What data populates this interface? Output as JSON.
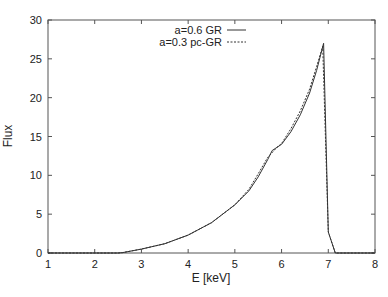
{
  "chart_data": {
    "type": "line",
    "title": "",
    "xlabel": "E [keV]",
    "ylabel": "Flux",
    "xlim": [
      1,
      8
    ],
    "ylim": [
      0,
      30
    ],
    "xticks": [
      1,
      2,
      3,
      4,
      5,
      6,
      7,
      8
    ],
    "yticks": [
      0,
      5,
      10,
      15,
      20,
      25,
      30
    ],
    "grid": false,
    "legend_position": "top-center-inside",
    "series": [
      {
        "name": "a=0.6 GR",
        "style": "solid",
        "color": "#333333",
        "x": [
          1,
          2.5,
          2.6,
          3,
          3.5,
          4,
          4.5,
          5,
          5.3,
          5.5,
          5.7,
          5.8,
          5.9,
          6.0,
          6.2,
          6.4,
          6.6,
          6.75,
          6.9,
          7.0,
          7.15,
          8
        ],
        "y": [
          0,
          0,
          0.05,
          0.5,
          1.2,
          2.3,
          3.9,
          6.2,
          8.0,
          9.8,
          12.0,
          13.2,
          13.6,
          14.0,
          15.6,
          17.8,
          20.6,
          23.5,
          27.0,
          2.7,
          0,
          0
        ]
      },
      {
        "name": "a=0.3 pc-GR",
        "style": "dashed",
        "color": "#333333",
        "x": [
          1,
          2.5,
          2.6,
          3,
          3.5,
          4,
          4.5,
          5,
          5.3,
          5.5,
          5.7,
          5.9,
          6.0,
          6.2,
          6.4,
          6.6,
          6.75,
          6.88,
          7.0,
          7.15,
          8
        ],
        "y": [
          0,
          0,
          0.05,
          0.5,
          1.2,
          2.3,
          3.9,
          6.2,
          8.2,
          10.2,
          12.3,
          13.6,
          14.1,
          16.0,
          18.3,
          21.1,
          24.0,
          26.6,
          2.7,
          0,
          0
        ]
      }
    ]
  },
  "plot_area": {
    "left": 48,
    "top": 20,
    "right": 375,
    "bottom": 253
  }
}
